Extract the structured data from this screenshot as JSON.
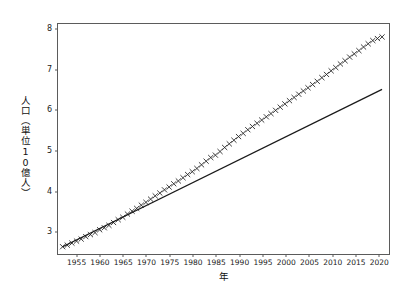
{
  "chart_data": {
    "type": "scatter",
    "title": "",
    "xlabel": "年",
    "ylabel": "人口（単位10億人）",
    "xlim": [
      1951.0,
      2022.5
    ],
    "ylim": [
      2.42,
      8.12
    ],
    "grid": false,
    "legend": "none",
    "yticks": [
      3,
      4,
      5,
      6,
      7,
      8
    ],
    "xticks": [
      1955,
      1960,
      1965,
      1970,
      1975,
      1980,
      1985,
      1990,
      1995,
      2000,
      2005,
      2010,
      2015,
      2020
    ],
    "series": [
      {
        "name": "人口",
        "type": "scatter",
        "marker": "x",
        "color": "#1a1a1a",
        "x": [
          1952,
          1953,
          1954,
          1955,
          1956,
          1957,
          1958,
          1959,
          1960,
          1961,
          1962,
          1963,
          1964,
          1965,
          1966,
          1967,
          1968,
          1969,
          1970,
          1971,
          1972,
          1973,
          1974,
          1975,
          1976,
          1977,
          1978,
          1979,
          1980,
          1981,
          1982,
          1983,
          1984,
          1985,
          1986,
          1987,
          1988,
          1989,
          1990,
          1991,
          1992,
          1993,
          1994,
          1995,
          1996,
          1997,
          1998,
          1999,
          2000,
          2001,
          2002,
          2003,
          2004,
          2005,
          2006,
          2007,
          2008,
          2009,
          2010,
          2011,
          2012,
          2013,
          2014,
          2015,
          2016,
          2017,
          2018,
          2019,
          2020,
          2021
        ],
        "y": [
          2.6,
          2.64,
          2.69,
          2.74,
          2.79,
          2.85,
          2.9,
          2.95,
          3.02,
          3.07,
          3.13,
          3.2,
          3.27,
          3.33,
          3.41,
          3.48,
          3.55,
          3.63,
          3.7,
          3.78,
          3.86,
          3.93,
          4.01,
          4.08,
          4.16,
          4.23,
          4.31,
          4.39,
          4.46,
          4.54,
          4.63,
          4.72,
          4.81,
          4.87,
          4.96,
          5.06,
          5.15,
          5.24,
          5.33,
          5.41,
          5.5,
          5.58,
          5.66,
          5.74,
          5.82,
          5.9,
          5.98,
          6.06,
          6.14,
          6.22,
          6.3,
          6.38,
          6.46,
          6.54,
          6.62,
          6.7,
          6.79,
          6.87,
          6.96,
          7.04,
          7.13,
          7.21,
          7.3,
          7.38,
          7.46,
          7.55,
          7.63,
          7.71,
          7.76,
          7.8
        ]
      },
      {
        "name": "線形近似",
        "type": "line",
        "color": "#1a1a1a",
        "x": [
          1952,
          2021
        ],
        "y": [
          2.6,
          6.5
        ]
      }
    ]
  }
}
